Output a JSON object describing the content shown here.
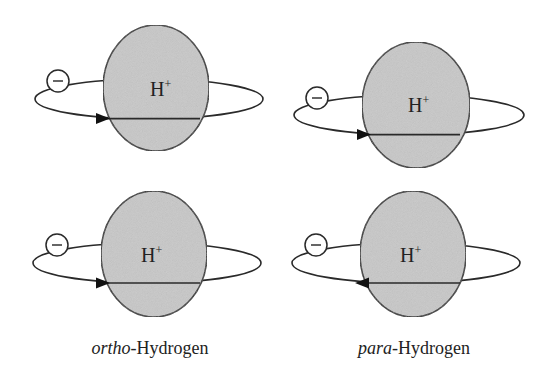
{
  "diagram": {
    "nucleus_label": "H",
    "nucleus_charge": "+",
    "electron_label": "−",
    "colors": {
      "nucleus_fill": "#c8c8c8",
      "stroke": "#2a2a2a",
      "background": "#ffffff"
    },
    "panels": [
      {
        "id": "ortho-top",
        "column": "ortho",
        "arrow_direction": "right"
      },
      {
        "id": "para-top",
        "column": "para",
        "arrow_direction": "right"
      },
      {
        "id": "ortho-bottom",
        "column": "ortho",
        "arrow_direction": "right"
      },
      {
        "id": "para-bottom",
        "column": "para",
        "arrow_direction": "left"
      }
    ],
    "captions": {
      "ortho": {
        "prefix": "ortho",
        "suffix": "-Hydrogen"
      },
      "para": {
        "prefix": "para",
        "suffix": "-Hydrogen"
      }
    }
  }
}
